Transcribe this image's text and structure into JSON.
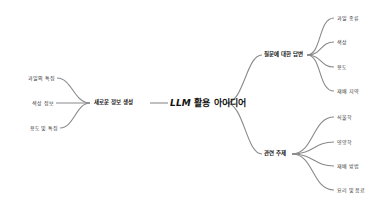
{
  "mindmap": {
    "root": {
      "prefix": "LLM",
      "label": "활용 아이디어"
    },
    "left_branches": [
      {
        "label": "새로운 정보 생성",
        "children": [
          "과일의 특징",
          "색상 정보",
          "용도 및 특징"
        ]
      }
    ],
    "right_branches": [
      {
        "label": "질문에 대한 답변",
        "children": [
          "과일 종류",
          "색상",
          "용도",
          "재배 지역"
        ]
      },
      {
        "label": "관련 주제",
        "children": [
          "식물학",
          "영양학",
          "재배 방법",
          "요리 및 음료"
        ]
      }
    ]
  },
  "colors": {
    "line": "#8a8a8a",
    "text": "#222222"
  }
}
